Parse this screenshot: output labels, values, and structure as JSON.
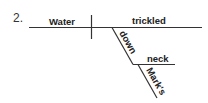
{
  "diagram": {
    "number": "2.",
    "type": "sentence-diagram",
    "subject": "Water",
    "verb": "trickled",
    "preposition": "down",
    "object_of_preposition": "neck",
    "possessive_modifier": "Mark's",
    "line_color": "#333333"
  }
}
